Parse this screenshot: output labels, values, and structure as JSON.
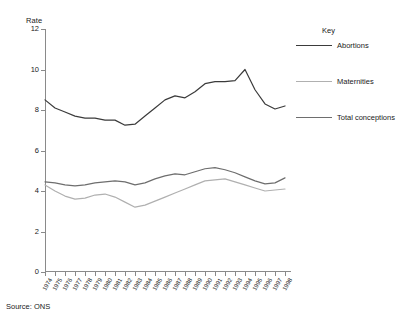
{
  "chart_data": {
    "type": "line",
    "title": "",
    "subtitle": "",
    "xlabel": "",
    "ylabel": "Rate",
    "ylim": [
      0,
      12
    ],
    "yticks": [
      0,
      2,
      4,
      6,
      8,
      10,
      12
    ],
    "grid": false,
    "legend_position": "right",
    "legend_title": "Key",
    "x": [
      "1974",
      "1975",
      "1976",
      "1977",
      "1978",
      "1979",
      "1980",
      "1981",
      "1982",
      "1983",
      "1984",
      "1985",
      "1986",
      "1987",
      "1988",
      "1989",
      "1990",
      "1991",
      "1992",
      "1993",
      "1994",
      "1995",
      "1996",
      "1997",
      "1998"
    ],
    "series": [
      {
        "name": "Abortions",
        "color": "#3b3b3b",
        "values": [
          8.5,
          8.1,
          7.9,
          7.7,
          7.6,
          7.6,
          7.5,
          7.5,
          7.25,
          7.3,
          7.7,
          8.1,
          8.5,
          8.7,
          8.6,
          8.9,
          9.3,
          9.4,
          9.4,
          9.45,
          10.0,
          9.0,
          8.3,
          8.05,
          8.2
        ]
      },
      {
        "name": "Maternities",
        "color": "#b0b0b0",
        "values": [
          4.3,
          4.0,
          3.75,
          3.6,
          3.65,
          3.8,
          3.85,
          3.7,
          3.45,
          3.2,
          3.3,
          3.5,
          3.7,
          3.9,
          4.1,
          4.3,
          4.5,
          4.55,
          4.6,
          4.45,
          4.3,
          4.15,
          4.0,
          4.05,
          4.1
        ]
      },
      {
        "name": "Total conceptions",
        "color": "#6e6e6e",
        "values": [
          4.45,
          4.4,
          4.3,
          4.25,
          4.3,
          4.4,
          4.45,
          4.5,
          4.45,
          4.3,
          4.4,
          4.6,
          4.75,
          4.85,
          4.8,
          4.95,
          5.1,
          5.15,
          5.05,
          4.9,
          4.7,
          4.5,
          4.35,
          4.4,
          4.65
        ]
      }
    ],
    "last_values_note": {
      "Abortions": 9.3,
      "Maternities": 4.6,
      "Total conceptions": 4.75
    }
  },
  "legend": {
    "title": "Key",
    "items": [
      {
        "label": "Abortions",
        "color": "#3b3b3b"
      },
      {
        "label": "Maternities",
        "color": "#b0b0b0"
      },
      {
        "label": "Total conceptions",
        "color": "#6e6e6e"
      }
    ]
  },
  "axes": {
    "y_title": "Rate"
  },
  "footer": {
    "source": "Source: ONS"
  }
}
